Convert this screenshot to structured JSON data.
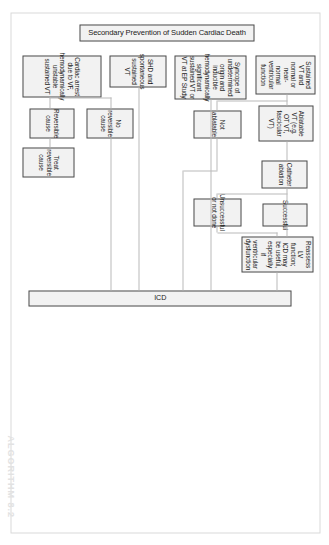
{
  "figure": {
    "title": "Secondary Prevention of Sudden Cardiac Death",
    "caption": "ALGORITHM 8.2",
    "orientation_degrees": 90,
    "colors": {
      "node_fill": "#f2f2f2",
      "node_border": "#4a4a4a",
      "connector": "#b9b9b9",
      "page_border": "#d9d9d9",
      "caption": "#e2e2e2",
      "background": "#ffffff"
    }
  },
  "nodes": {
    "title": "Secondary Prevention of Sudden Cardiac Death",
    "indication_cardiac_arrest": "Cardiac arrest due to VF, hemodynamically unstable sustained VT",
    "indication_shd_vt": "SHD and spontaneous sustained VT",
    "indication_syncope": "Syncope of undetermined origin and inducible hemodynamically significant sustained VT or VT at EP Study",
    "indication_sustained_vt_normal": "Sustained VT and normal or near-normal ventricular function",
    "reversible_cause": "Reversible cause",
    "treat_reversible_cause": "Treat reversible cause",
    "no_reversible_cause": "No reversible cause",
    "ablatable_vt": "Ablatable VT (e.g. OT VT, fascicular VT)",
    "not_ablatable": "Not ablatable",
    "catheter_ablation": "Catheter ablation",
    "successful": "Successful",
    "unsuccessful_or_not_done": "Unsuccessful or not done",
    "reassess_lv": "Reassess LV function; ICD may be useful, especially if ventricular dysfunction",
    "icd": "ICD"
  }
}
